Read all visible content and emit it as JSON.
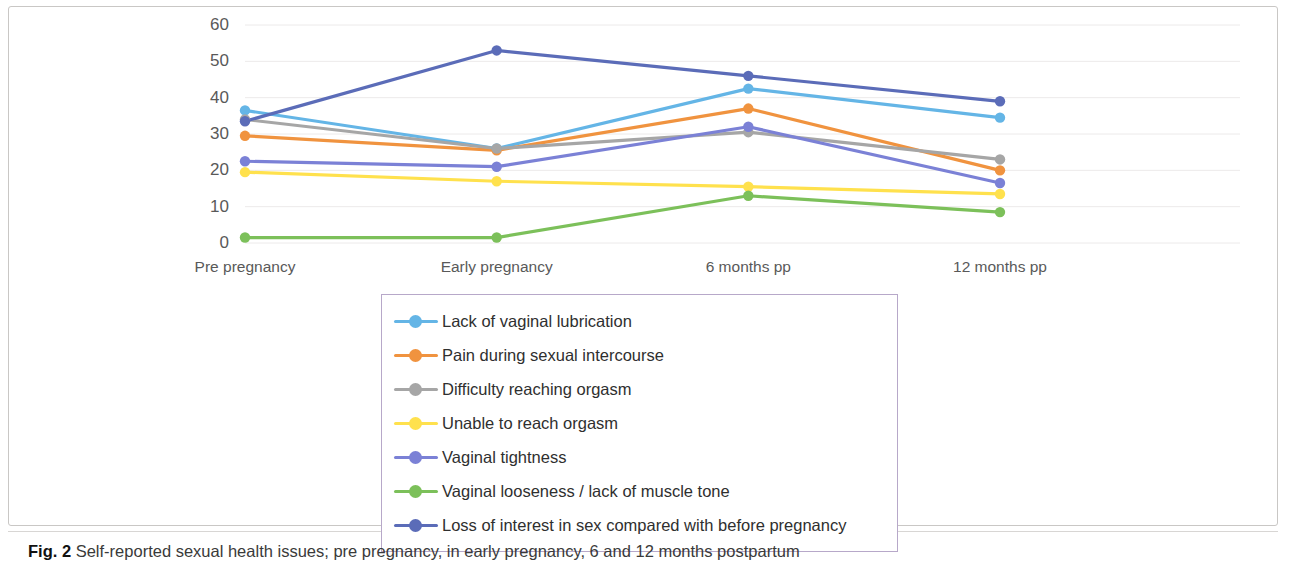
{
  "figure": {
    "label": "Fig. 2",
    "caption": "Self-reported sexual health issues; pre pregnancy, in early pregnancy, 6 and 12 months postpartum"
  },
  "chart_data": {
    "type": "line",
    "title": "",
    "xlabel": "",
    "ylabel": "",
    "categories": [
      "Pre pregnancy",
      "Early pregnancy",
      "6 months pp",
      "12 months pp"
    ],
    "ylim": [
      0,
      60
    ],
    "yticks": [
      0,
      10,
      20,
      30,
      40,
      50,
      60
    ],
    "grid": true,
    "grid_axis": "y",
    "legend_position": "below-plot",
    "markers": true,
    "series": [
      {
        "name": "Lack of vaginal lubrication",
        "color": "#64B5E6",
        "values": [
          36.5,
          26,
          42.5,
          34.5
        ]
      },
      {
        "name": "Pain during sexual intercourse",
        "color": "#F0933F",
        "values": [
          29.5,
          25.5,
          37,
          20
        ]
      },
      {
        "name": "Difficulty reaching orgasm",
        "color": "#A6A6A6",
        "values": [
          34,
          26,
          30.5,
          23
        ]
      },
      {
        "name": "Unable to reach orgasm",
        "color": "#FFE14D",
        "values": [
          19.5,
          17,
          15.5,
          13.5
        ]
      },
      {
        "name": "Vaginal tightness",
        "color": "#7B81D6",
        "values": [
          22.5,
          21,
          32,
          16.5
        ]
      },
      {
        "name": "Vaginal looseness / lack of muscle tone",
        "color": "#7CC05A",
        "values": [
          1.5,
          1.5,
          13,
          8.5
        ]
      },
      {
        "name": "Loss of interest in sex compared with before pregnancy",
        "color": "#5B6CB8",
        "values": [
          33.5,
          53,
          46,
          39
        ]
      }
    ]
  }
}
